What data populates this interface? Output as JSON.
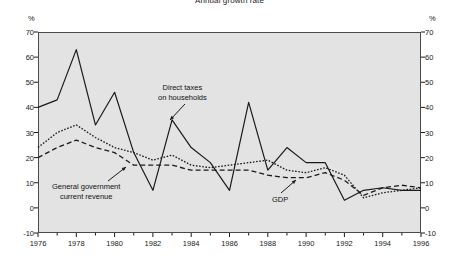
{
  "chart_data": {
    "type": "line",
    "title": "Annual growth rate",
    "xlabel": "",
    "ylabel": "%",
    "ylabel_right": "%",
    "ylim": [
      -10,
      70
    ],
    "xlim": [
      1976,
      1996
    ],
    "yticks": [
      70,
      60,
      50,
      40,
      30,
      20,
      10,
      0,
      -10
    ],
    "xticks": [
      1976,
      1978,
      1980,
      1982,
      1984,
      1986,
      1988,
      1990,
      1992,
      1994,
      1996
    ],
    "x": [
      1976,
      1977,
      1978,
      1979,
      1980,
      1981,
      1982,
      1983,
      1984,
      1985,
      1986,
      1987,
      1988,
      1989,
      1990,
      1991,
      1992,
      1993,
      1994,
      1995,
      1996
    ],
    "grid": false,
    "legend_position": "inline-annotations",
    "plot_background": "#e3e3e3",
    "line_color": "#1a1a1a",
    "series": [
      {
        "name": "Direct taxes on households",
        "style": "solid",
        "values": [
          40,
          43,
          63,
          33,
          46,
          22,
          7,
          35,
          24,
          18,
          7,
          42,
          15,
          24,
          18,
          18,
          3,
          7,
          8,
          7,
          7
        ]
      },
      {
        "name": "General government current revenue",
        "style": "dotted",
        "values": [
          24,
          30,
          33,
          28,
          24,
          22,
          19,
          21,
          17,
          16,
          17,
          18,
          19,
          15,
          14,
          16,
          13,
          4,
          6,
          7,
          8
        ]
      },
      {
        "name": "GDP",
        "style": "dashed",
        "values": [
          20,
          24,
          27,
          24,
          22,
          17,
          17,
          17,
          15,
          15,
          15,
          15,
          13,
          12,
          12,
          14,
          11,
          5,
          8,
          9,
          8
        ]
      }
    ],
    "annotations": [
      {
        "text_line1": "Direct taxes",
        "text_line2": "on households",
        "target_series": "Direct taxes on households"
      },
      {
        "text_line1": "General government",
        "text_line2": "current revenue",
        "target_series": "General government current revenue"
      },
      {
        "text_line1": "GDP",
        "text_line2": "",
        "target_series": "GDP"
      }
    ]
  }
}
